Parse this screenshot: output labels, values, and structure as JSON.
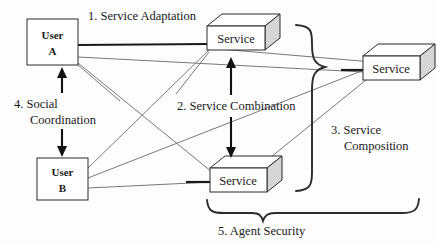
{
  "diagram": {
    "nodes": [
      {
        "id": "user-a",
        "type": "plain-box",
        "line1": "User",
        "line2": "A"
      },
      {
        "id": "user-b",
        "type": "plain-box",
        "line1": "User",
        "line2": "B"
      },
      {
        "id": "service-1",
        "type": "cube",
        "label": "Service"
      },
      {
        "id": "service-2",
        "type": "cube",
        "label": "Service"
      },
      {
        "id": "service-3",
        "type": "cube",
        "label": "Service"
      }
    ],
    "annotations": [
      {
        "id": "ann-1",
        "number": "1.",
        "line1": "1. Service Adaptation",
        "line2": ""
      },
      {
        "id": "ann-2",
        "number": "2.",
        "line1": "2. Service Combination",
        "line2": ""
      },
      {
        "id": "ann-3",
        "number": "3.",
        "line1": "3. Service",
        "line2": "Composition"
      },
      {
        "id": "ann-4",
        "number": "4.",
        "line1": "4. Social",
        "line2": "Coordination"
      },
      {
        "id": "ann-5",
        "number": "5.",
        "line1": "5. Agent Security",
        "line2": ""
      }
    ],
    "colors": {
      "background": "#fdfdfd",
      "stroke": "#2b2b2b",
      "thin_link": "#6a6a6a",
      "cube_side": "#d6d6d6",
      "text": "#1a1a1a"
    }
  }
}
